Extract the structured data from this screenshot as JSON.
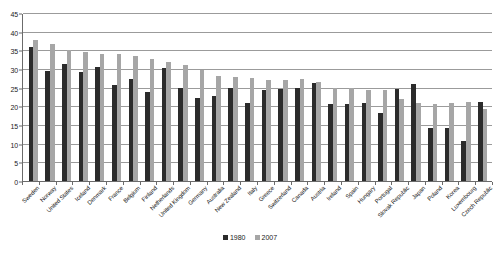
{
  "chart_data": {
    "type": "bar",
    "title": "",
    "subtitle": "",
    "xlabel": "",
    "ylabel": "",
    "ylim": [
      0,
      45
    ],
    "ytick_step": 5,
    "yticks": [
      0,
      5,
      10,
      15,
      20,
      25,
      30,
      35,
      40,
      45
    ],
    "grid": true,
    "legend_position": "bottom-center",
    "categories": [
      "Sweden",
      "Norway",
      "United States",
      "Iceland",
      "Denmark",
      "France",
      "Belgium",
      "Finland",
      "Netherlands",
      "United Kingdom",
      "Germany",
      "Australia",
      "New Zealand",
      "Italy",
      "Greece",
      "Switzerland",
      "Canada",
      "Austria",
      "Ireland",
      "Spain",
      "Hungary",
      "Portugal",
      "Slovak Republic",
      "Japan",
      "Poland",
      "Korea",
      "Luxembourg",
      "Czech Republic"
    ],
    "series": [
      {
        "name": "1980",
        "color": "#2b2b2b",
        "values": [
          35.8,
          29.5,
          31.4,
          29.3,
          30.6,
          25.8,
          27.4,
          23.8,
          30.3,
          24.9,
          22.2,
          22.8,
          24.8,
          21.0,
          24.5,
          24.6,
          24.8,
          26.2,
          20.5,
          20.5,
          20.9,
          18.2,
          24.6,
          26.0,
          14.2,
          14.2,
          10.8,
          21.2
        ]
      },
      {
        "name": "2007",
        "color": "#a6a6a6",
        "values": [
          37.9,
          36.8,
          35.0,
          34.5,
          34.1,
          34.0,
          33.4,
          32.8,
          31.8,
          31.1,
          29.8,
          28.1,
          27.8,
          27.5,
          27.0,
          27.0,
          27.3,
          26.5,
          25.0,
          24.8,
          24.5,
          24.3,
          22.0,
          21.0,
          20.5,
          21.0,
          21.2,
          19.3
        ]
      }
    ]
  },
  "legend": {
    "items": [
      {
        "label": "1980",
        "color": "#2b2b2b"
      },
      {
        "label": "2007",
        "color": "#a6a6a6"
      }
    ]
  },
  "axes": {
    "y": {
      "min": 0,
      "max": 45,
      "ticks": [
        "0",
        "5",
        "10",
        "15",
        "20",
        "25",
        "30",
        "35",
        "40",
        "45"
      ]
    }
  }
}
